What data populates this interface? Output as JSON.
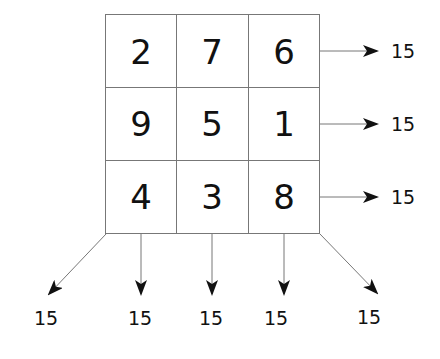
{
  "grid": {
    "rows": [
      [
        "2",
        "7",
        "6"
      ],
      [
        "9",
        "5",
        "1"
      ],
      [
        "4",
        "3",
        "8"
      ]
    ]
  },
  "sums": {
    "rows": [
      "15",
      "15",
      "15"
    ],
    "diagonal_left": "15",
    "columns": [
      "15",
      "15",
      "15"
    ],
    "diagonal_right": "15"
  },
  "colors": {
    "grid_line": "#777777",
    "arrow": "#111111",
    "text": "#111111"
  }
}
